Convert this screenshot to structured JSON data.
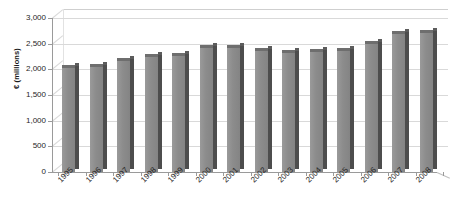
{
  "chart_data": {
    "type": "bar",
    "title": "",
    "subtitle": "",
    "xlabel": "",
    "ylabel": "€ (millions)",
    "ylim": [
      0,
      3000
    ],
    "ytick_labels": [
      "0",
      "500",
      "1,000",
      "1,500",
      "2,000",
      "2,500",
      "3,000"
    ],
    "ytick_values": [
      0,
      500,
      1000,
      1500,
      2000,
      2500,
      3000
    ],
    "grid": true,
    "legend": "none",
    "categories": [
      "1995",
      "1996",
      "1997",
      "1998",
      "1999",
      "2000",
      "2001",
      "2002",
      "2003",
      "2004",
      "2005",
      "2006",
      "2007",
      "2008"
    ],
    "values": [
      2090,
      2110,
      2220,
      2300,
      2320,
      2470,
      2470,
      2420,
      2370,
      2390,
      2420,
      2560,
      2740,
      2760
    ],
    "series": [
      {
        "name": "",
        "values": [
          2090,
          2110,
          2220,
          2300,
          2320,
          2470,
          2470,
          2420,
          2370,
          2390,
          2420,
          2560,
          2740,
          2760
        ]
      }
    ],
    "style": "3d-column",
    "annotations": []
  },
  "colors": {
    "bar_face": "#8c8c8c",
    "bar_side": "#4d4d4d",
    "bar_top": "#6e6e6e",
    "gridline": "#d9d9d9",
    "axis": "#9a9a9a",
    "background": "#ffffff",
    "text": "#262626"
  }
}
